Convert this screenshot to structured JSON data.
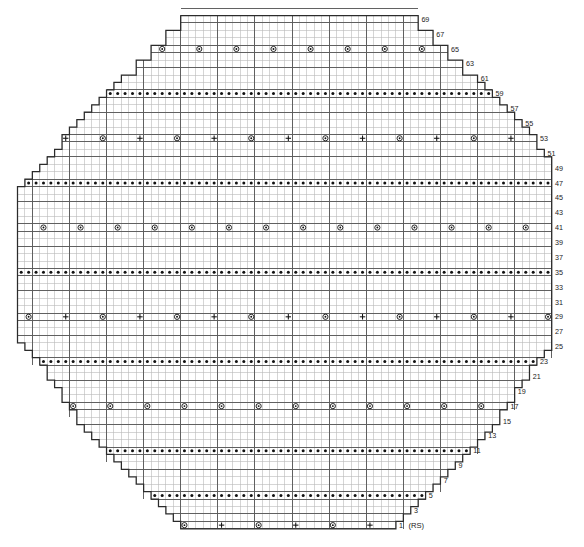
{
  "chart": {
    "type": "knitting-chart",
    "geometry": {
      "cell_w": 7.42,
      "cell_h": 7.44,
      "origin_x": 17.5,
      "origin_y": 15.5,
      "columns": 72,
      "rows": 69,
      "heavy_every_col": 5,
      "heavy_every_row": 6
    },
    "colors": {
      "grid_light": "#b9b9b9",
      "grid_heavy": "#5a5a5a",
      "outline": "#2b2b2b",
      "symbol": "#111111",
      "label": "#1a1a1a",
      "background": "#ffffff"
    },
    "symbol_legend": [
      {
        "key": "yo",
        "glyph": "circle-dot",
        "name": "yarn-over"
      },
      {
        "key": "k",
        "glyph": "plus",
        "name": "knit-plus"
      },
      {
        "key": "p",
        "glyph": "dot",
        "name": "purl-dot"
      }
    ],
    "row_numbers_right": [
      69,
      67,
      65,
      63,
      61,
      59,
      57,
      55,
      53,
      51,
      49,
      47,
      45,
      43,
      41,
      39,
      37,
      35,
      33,
      31,
      29,
      27,
      25,
      23,
      21,
      19,
      17,
      15,
      13,
      11,
      9,
      7,
      5,
      3,
      1
    ],
    "rs_marker": "(RS)",
    "row_extents": [
      {
        "row": 69,
        "start": 22,
        "end": 53
      },
      {
        "row": 68,
        "start": 22,
        "end": 53
      },
      {
        "row": 67,
        "start": 20,
        "end": 55
      },
      {
        "row": 66,
        "start": 20,
        "end": 55
      },
      {
        "row": 65,
        "start": 18,
        "end": 57
      },
      {
        "row": 64,
        "start": 18,
        "end": 57
      },
      {
        "row": 63,
        "start": 16,
        "end": 59
      },
      {
        "row": 62,
        "start": 16,
        "end": 59
      },
      {
        "row": 61,
        "start": 14,
        "end": 61
      },
      {
        "row": 60,
        "start": 13,
        "end": 62
      },
      {
        "row": 59,
        "start": 12,
        "end": 63
      },
      {
        "row": 58,
        "start": 11,
        "end": 64
      },
      {
        "row": 57,
        "start": 10,
        "end": 65
      },
      {
        "row": 56,
        "start": 9,
        "end": 66
      },
      {
        "row": 55,
        "start": 8,
        "end": 67
      },
      {
        "row": 54,
        "start": 7,
        "end": 68
      },
      {
        "row": 53,
        "start": 6,
        "end": 69
      },
      {
        "row": 52,
        "start": 6,
        "end": 69
      },
      {
        "row": 51,
        "start": 5,
        "end": 70
      },
      {
        "row": 50,
        "start": 4,
        "end": 71
      },
      {
        "row": 49,
        "start": 3,
        "end": 71
      },
      {
        "row": 48,
        "start": 2,
        "end": 71
      },
      {
        "row": 47,
        "start": 1,
        "end": 71
      },
      {
        "row": 46,
        "start": 0,
        "end": 71
      },
      {
        "row": 45,
        "start": 0,
        "end": 71
      },
      {
        "row": 44,
        "start": 0,
        "end": 71
      },
      {
        "row": 43,
        "start": 0,
        "end": 71
      },
      {
        "row": 42,
        "start": 0,
        "end": 71
      },
      {
        "row": 41,
        "start": 0,
        "end": 71
      },
      {
        "row": 40,
        "start": 0,
        "end": 71
      },
      {
        "row": 39,
        "start": 0,
        "end": 71
      },
      {
        "row": 38,
        "start": 0,
        "end": 71
      },
      {
        "row": 37,
        "start": 0,
        "end": 71
      },
      {
        "row": 36,
        "start": 0,
        "end": 71
      },
      {
        "row": 35,
        "start": 0,
        "end": 71
      },
      {
        "row": 34,
        "start": 0,
        "end": 71
      },
      {
        "row": 33,
        "start": 0,
        "end": 71
      },
      {
        "row": 32,
        "start": 0,
        "end": 71
      },
      {
        "row": 31,
        "start": 0,
        "end": 71
      },
      {
        "row": 30,
        "start": 0,
        "end": 71
      },
      {
        "row": 29,
        "start": 0,
        "end": 71
      },
      {
        "row": 28,
        "start": 0,
        "end": 71
      },
      {
        "row": 27,
        "start": 0,
        "end": 71
      },
      {
        "row": 26,
        "start": 0,
        "end": 71
      },
      {
        "row": 25,
        "start": 1,
        "end": 71
      },
      {
        "row": 24,
        "start": 2,
        "end": 70
      },
      {
        "row": 23,
        "start": 3,
        "end": 69
      },
      {
        "row": 22,
        "start": 4,
        "end": 68
      },
      {
        "row": 21,
        "start": 4,
        "end": 68
      },
      {
        "row": 20,
        "start": 5,
        "end": 67
      },
      {
        "row": 19,
        "start": 6,
        "end": 66
      },
      {
        "row": 18,
        "start": 6,
        "end": 66
      },
      {
        "row": 17,
        "start": 7,
        "end": 65
      },
      {
        "row": 16,
        "start": 8,
        "end": 64
      },
      {
        "row": 15,
        "start": 8,
        "end": 64
      },
      {
        "row": 14,
        "start": 9,
        "end": 63
      },
      {
        "row": 13,
        "start": 10,
        "end": 62
      },
      {
        "row": 12,
        "start": 11,
        "end": 61
      },
      {
        "row": 11,
        "start": 12,
        "end": 60
      },
      {
        "row": 10,
        "start": 13,
        "end": 59
      },
      {
        "row": 9,
        "start": 14,
        "end": 58
      },
      {
        "row": 8,
        "start": 15,
        "end": 57
      },
      {
        "row": 7,
        "start": 16,
        "end": 56
      },
      {
        "row": 6,
        "start": 17,
        "end": 55
      },
      {
        "row": 5,
        "start": 18,
        "end": 54
      },
      {
        "row": 4,
        "start": 19,
        "end": 53
      },
      {
        "row": 3,
        "start": 20,
        "end": 52
      },
      {
        "row": 2,
        "start": 21,
        "end": 51
      },
      {
        "row": 1,
        "start": 22,
        "end": 50
      }
    ],
    "symbol_rows": [
      {
        "row": 65,
        "pattern": "yo",
        "offset": 1,
        "step": 5
      },
      {
        "row": 59,
        "pattern": "purl",
        "offset": 0,
        "step": 1
      },
      {
        "row": 53,
        "pattern": "alt_k_yo",
        "offset": 0,
        "step": 5
      },
      {
        "row": 47,
        "pattern": "purl",
        "offset": 0,
        "step": 1
      },
      {
        "row": 41,
        "pattern": "yo",
        "offset": 3,
        "step": 5
      },
      {
        "row": 35,
        "pattern": "purl",
        "offset": 0,
        "step": 1
      },
      {
        "row": 29,
        "pattern": "alt_yo_k",
        "offset": 1,
        "step": 5
      },
      {
        "row": 23,
        "pattern": "purl",
        "offset": 0,
        "step": 1
      },
      {
        "row": 17,
        "pattern": "yo",
        "offset": 0,
        "step": 5
      },
      {
        "row": 11,
        "pattern": "purl",
        "offset": 0,
        "step": 1
      },
      {
        "row": 5,
        "pattern": "purl_sparse",
        "offset": 0,
        "step": 1
      },
      {
        "row": 1,
        "pattern": "alt_yo_k",
        "offset": 0,
        "step": 5
      }
    ]
  }
}
